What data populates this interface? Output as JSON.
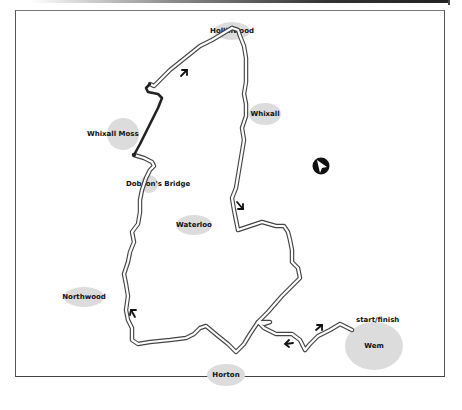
{
  "map": {
    "title": "",
    "places": [
      {
        "id": "hollinwood",
        "label": "Hollinwood"
      },
      {
        "id": "whixall",
        "label": "Whixall"
      },
      {
        "id": "whixall-moss",
        "label": "Whixall Moss"
      },
      {
        "id": "dobsons-bridge",
        "label": "Dobson's Bridge"
      },
      {
        "id": "waterloo",
        "label": "Waterloo"
      },
      {
        "id": "northwood",
        "label": "Northwood"
      },
      {
        "id": "horton",
        "label": "Horton"
      },
      {
        "id": "wem",
        "label": "Wem"
      }
    ],
    "annotations": {
      "start_finish": "start/finish"
    },
    "north_arrow": "north-arrow-icon",
    "colors": {
      "place_fill": "#dcdcdc",
      "route_outline": "#333333",
      "highlight_segment": "#222222",
      "frame": "#555555"
    }
  }
}
